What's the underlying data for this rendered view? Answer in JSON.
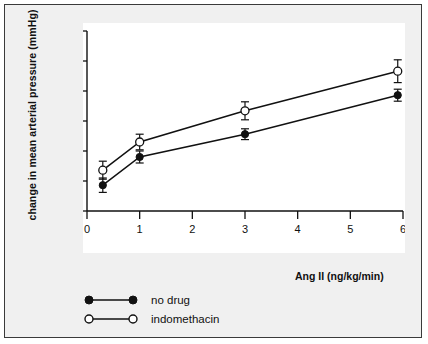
{
  "chart_data": {
    "type": "line",
    "title": "",
    "xlabel": "Ang II (ng/kg/min)",
    "ylabel": "change in mean arterial pressure (mmHg)",
    "xlim": [
      0,
      6
    ],
    "ylim": [
      -5,
      25
    ],
    "xticks": [
      "0",
      "1",
      "2",
      "3",
      "4",
      "5",
      "6"
    ],
    "yticks": [
      "-5",
      "0",
      "5",
      "10",
      "15",
      "20",
      "25"
    ],
    "grid": false,
    "legend_position": "below-plot-left",
    "series": [
      {
        "name": "no drug",
        "marker": "filled-circle",
        "x": [
          0.3,
          1.0,
          3.0,
          5.9
        ],
        "values": [
          -0.7,
          4.0,
          7.8,
          14.3
        ],
        "errors": [
          1.2,
          1.0,
          0.9,
          1.0
        ]
      },
      {
        "name": "indomethacin",
        "marker": "open-circle",
        "x": [
          0.3,
          1.0,
          3.0,
          5.9
        ],
        "values": [
          1.8,
          6.5,
          11.7,
          18.3
        ],
        "errors": [
          1.5,
          1.3,
          1.5,
          1.9
        ]
      }
    ]
  },
  "legend": {
    "items": [
      {
        "label": "no drug",
        "marker": "filled-circle"
      },
      {
        "label": "indomethacin",
        "marker": "open-circle"
      }
    ]
  },
  "colors": {
    "ink": "#111111",
    "plot_background": "#ffffff",
    "page_background": "#f0f0f0",
    "border": "#3a3a3a"
  }
}
